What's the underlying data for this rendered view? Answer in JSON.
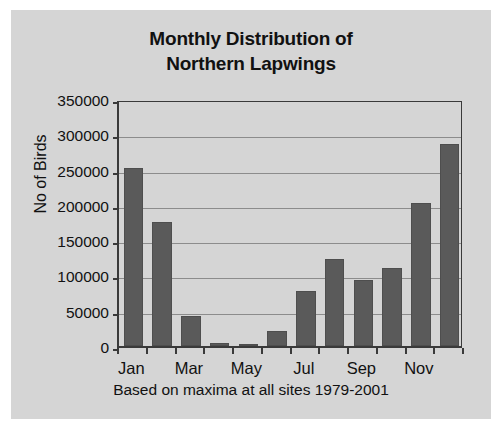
{
  "chart_data": {
    "type": "bar",
    "title": "Monthly Distribution of Northern Lapwings",
    "title_lines": [
      "Monthly Distribution of",
      "Northern Lapwings"
    ],
    "xlabel": "Based on maxima at all sites 1979-2001",
    "ylabel": "No of Birds",
    "categories": [
      "Jan",
      "Feb",
      "Mar",
      "Apr",
      "May",
      "Jun",
      "Jul",
      "Aug",
      "Sep",
      "Oct",
      "Nov",
      "Dec"
    ],
    "values": [
      252000,
      176000,
      42000,
      4000,
      3000,
      21000,
      78000,
      123000,
      93000,
      111000,
      202000,
      286000
    ],
    "ylim": [
      0,
      350000
    ],
    "ytick_values": [
      0,
      50000,
      100000,
      150000,
      200000,
      250000,
      300000,
      350000
    ],
    "ytick_labels": [
      "0",
      "50000",
      "100000",
      "150000",
      "200000",
      "250000",
      "300000",
      "350000"
    ],
    "xtick_labels": [
      "Jan",
      "Mar",
      "May",
      "Jul",
      "Sep",
      "Nov"
    ],
    "xtick_indices": [
      0,
      2,
      4,
      6,
      8,
      10
    ],
    "grid": true,
    "legend": false,
    "legend_position": "none",
    "bar_color": "#5a5a5a",
    "plot_background": "#d5d5d5",
    "axis_color": "#3a3a3a",
    "gridline_color": "#8c8c8c"
  }
}
